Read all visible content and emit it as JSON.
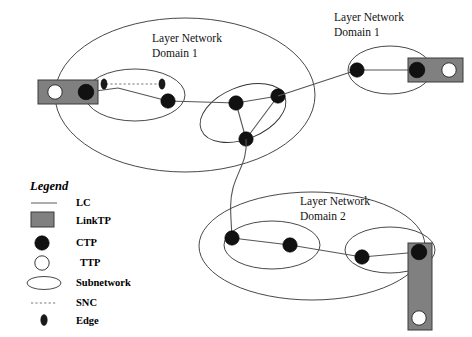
{
  "figure": {
    "type": "network-topology-diagram",
    "background_color": "#ffffff"
  },
  "colors": {
    "linktp_fill": "#808080",
    "ctp_fill": "#111111",
    "ttp_fill": "#ffffff",
    "line": "#555555",
    "ellipse_stroke": "#333333",
    "snc_stroke": "#777777"
  },
  "domains": [
    {
      "id": "domain-1-left",
      "label_line1": "Layer Network",
      "label_line2": "Domain 1"
    },
    {
      "id": "domain-1-right",
      "label_line1": "Layer Network",
      "label_line2": "Domain 1"
    },
    {
      "id": "domain-2-bottom",
      "label_line1": "Layer Network",
      "label_line2": "Domain 2"
    }
  ],
  "legend": {
    "title": "Legend",
    "items": [
      {
        "symbol": "line-swatch",
        "label": "LC"
      },
      {
        "symbol": "rect-swatch",
        "label": "LinkTP"
      },
      {
        "symbol": "filled-circle-swatch",
        "label": "CTP"
      },
      {
        "symbol": "open-circle-swatch",
        "label": "TTP"
      },
      {
        "symbol": "ellipse-swatch",
        "label": "Subnetwork"
      },
      {
        "symbol": "dashed-line-swatch",
        "label": "SNC"
      },
      {
        "symbol": "edge-diamond-swatch",
        "label": "Edge"
      }
    ]
  },
  "nodes": {
    "ctp_count": 11,
    "ttp_count": 3,
    "linktp_count": 3,
    "edge_count": 2,
    "snc_count": 1,
    "subnetwork_count": 8
  }
}
